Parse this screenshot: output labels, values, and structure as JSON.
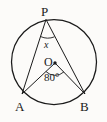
{
  "figure": {
    "type": "geometry-diagram",
    "background_color": "#fcfbf9",
    "stroke_color": "#1a1a1a",
    "labels": {
      "point_p": "P",
      "point_a": "A",
      "point_b": "B",
      "center_o": "O",
      "inscribed_angle": "x",
      "central_angle": "80°"
    },
    "geometry": {
      "circle": {
        "cx": 54,
        "cy": 62,
        "r": 42.5
      },
      "points": {
        "P": {
          "x": 46,
          "y": 19.5
        },
        "A": {
          "x": 22,
          "y": 94
        },
        "B": {
          "x": 85,
          "y": 94
        },
        "O": {
          "x": 55,
          "y": 63
        }
      },
      "segments": [
        {
          "name": "PA",
          "from": "P",
          "to": "A"
        },
        {
          "name": "PB",
          "from": "P",
          "to": "B"
        },
        {
          "name": "OA",
          "from": "O",
          "to": "A"
        },
        {
          "name": "OB",
          "from": "O",
          "to": "B"
        },
        {
          "name": "AB",
          "from": "A",
          "to": "B"
        }
      ],
      "angle_marks": [
        {
          "at": "P",
          "label": "x",
          "radius": 17
        },
        {
          "at": "O",
          "label": "80°",
          "radius": 13
        }
      ]
    }
  }
}
